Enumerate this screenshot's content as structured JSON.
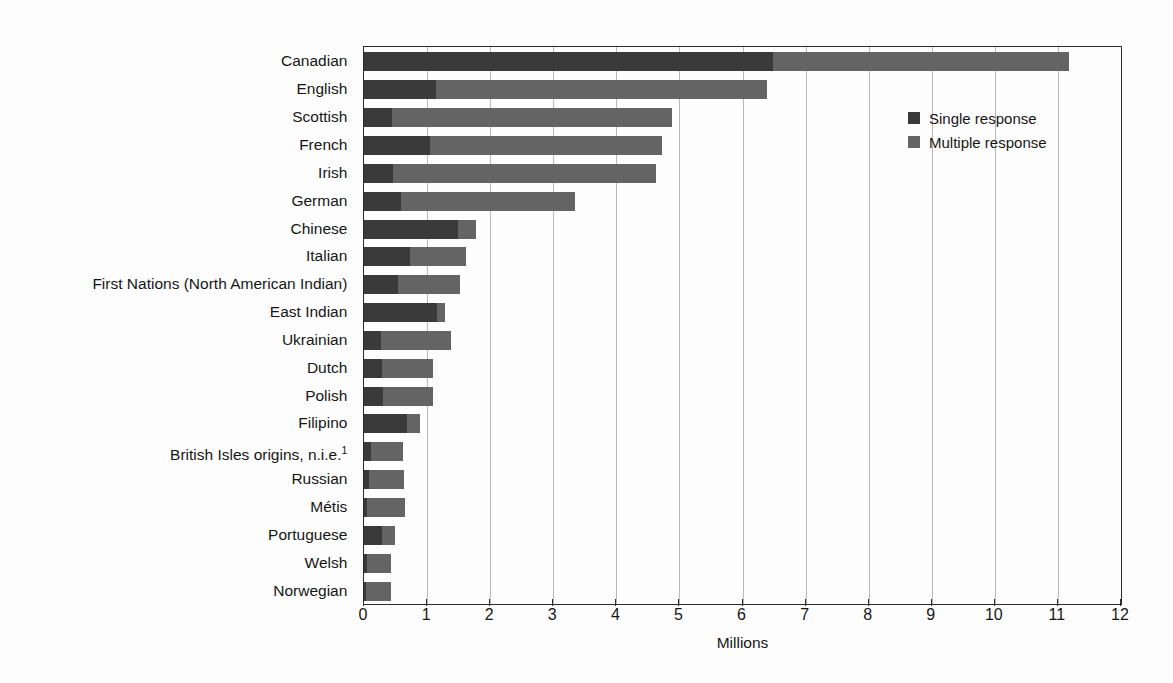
{
  "chart_data": {
    "type": "bar",
    "orientation": "horizontal",
    "stacked": true,
    "title": "",
    "xlabel": "Millions",
    "ylabel": "",
    "xlim": [
      0,
      12
    ],
    "xticks": [
      0,
      1,
      2,
      3,
      4,
      5,
      6,
      7,
      8,
      9,
      10,
      11,
      12
    ],
    "grid": "vertical",
    "legend_position": "top-right",
    "legend": [
      "Single response",
      "Multiple response"
    ],
    "colors": {
      "single": "#3a3a3a",
      "multiple": "#646464"
    },
    "categories": [
      "Canadian",
      "English",
      "Scottish",
      "French",
      "Irish",
      "German",
      "Chinese",
      "Italian",
      "First Nations (North American Indian)",
      "East Indian",
      "Ukrainian",
      "Dutch",
      "Polish",
      "Filipino",
      "British Isles origins, n.i.e.",
      "Russian",
      "Métis",
      "Portuguese",
      "Welsh",
      "Norwegian"
    ],
    "category_footnotes": {
      "British Isles origins, n.i.e.": "1"
    },
    "series": [
      {
        "name": "Single response",
        "values": [
          6.48,
          1.14,
          0.44,
          1.04,
          0.46,
          0.58,
          1.49,
          0.73,
          0.54,
          1.15,
          0.27,
          0.28,
          0.3,
          0.68,
          0.11,
          0.08,
          0.05,
          0.28,
          0.04,
          0.03
        ]
      },
      {
        "name": "Multiple response",
        "values": [
          4.7,
          5.25,
          4.45,
          3.69,
          4.17,
          2.77,
          0.28,
          0.88,
          0.98,
          0.13,
          1.11,
          0.81,
          0.79,
          0.21,
          0.51,
          0.55,
          0.6,
          0.21,
          0.39,
          0.4
        ]
      }
    ],
    "totals": [
      11.18,
      6.39,
      4.89,
      4.73,
      4.63,
      3.35,
      1.77,
      1.61,
      1.52,
      1.28,
      1.38,
      1.09,
      1.09,
      0.89,
      0.62,
      0.63,
      0.65,
      0.49,
      0.43,
      0.43
    ]
  }
}
